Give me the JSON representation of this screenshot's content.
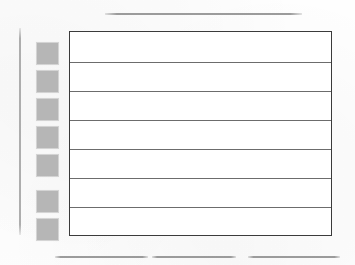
{
  "document": {
    "kind": "scanned-form-page",
    "page_background": "#fefefe",
    "ink_color": "#3b3b3b",
    "marker_color": "#b6b6b6",
    "rule_color": "#969696"
  },
  "top_rules": [
    {
      "name": "top-rule",
      "x": 105,
      "y": 13,
      "width": 197
    }
  ],
  "left_margin_rule": {
    "name": "left-margin-rule",
    "x": 19,
    "y": 28,
    "height": 207
  },
  "markers": [
    {
      "label": "",
      "x": 37,
      "y": 43
    },
    {
      "label": "",
      "x": 37,
      "y": 71
    },
    {
      "label": "",
      "x": 37,
      "y": 99
    },
    {
      "label": "",
      "x": 37,
      "y": 127
    },
    {
      "label": "",
      "x": 37,
      "y": 155
    },
    {
      "label": "",
      "x": 37,
      "y": 191
    },
    {
      "label": "",
      "x": 37,
      "y": 219
    }
  ],
  "table": {
    "x": 69,
    "y": 31,
    "width": 263,
    "height": 205,
    "column_headers": [
      ""
    ],
    "row_divider_offsets": [
      30,
      59,
      88,
      117,
      146,
      175
    ],
    "rows": [
      {
        "cells": [
          ""
        ]
      },
      {
        "cells": [
          ""
        ]
      },
      {
        "cells": [
          ""
        ]
      },
      {
        "cells": [
          ""
        ]
      },
      {
        "cells": [
          ""
        ]
      },
      {
        "cells": [
          ""
        ]
      },
      {
        "cells": [
          ""
        ]
      }
    ]
  },
  "bottom_rules": [
    {
      "name": "bottom-rule-left",
      "x": 55,
      "y": 256,
      "width": 93
    },
    {
      "name": "bottom-rule-center",
      "x": 152,
      "y": 256,
      "width": 84
    },
    {
      "name": "bottom-rule-right",
      "x": 248,
      "y": 256,
      "width": 92
    }
  ]
}
